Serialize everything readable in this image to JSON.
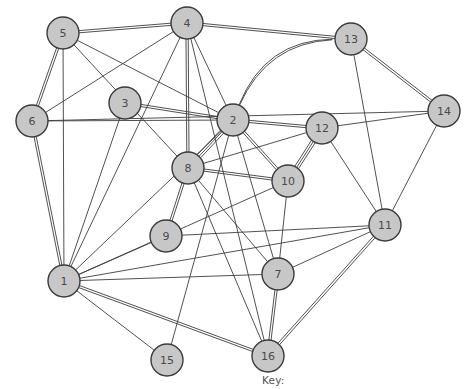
{
  "figure": {
    "title": "",
    "key_label": "Key:",
    "background": "#ffffff",
    "node_fill": "#c7c7c7",
    "node_stroke": "#3a3a3a",
    "edge_color": "#3d3d3d",
    "label_color": "#4a4a4a"
  },
  "chart_data": {
    "type": "scatter",
    "title": "",
    "xlabel": "",
    "ylabel": "",
    "graph_kind": "undirected-multigraph",
    "node_count": 16,
    "edge_count": 43,
    "node_radius": 16,
    "nodes": [
      {
        "id": "1",
        "label": "1",
        "x": 64,
        "y": 281
      },
      {
        "id": "2",
        "label": "2",
        "x": 233,
        "y": 120
      },
      {
        "id": "3",
        "label": "3",
        "x": 125,
        "y": 103
      },
      {
        "id": "4",
        "label": "4",
        "x": 187,
        "y": 23
      },
      {
        "id": "5",
        "label": "5",
        "x": 63,
        "y": 33
      },
      {
        "id": "6",
        "label": "6",
        "x": 32,
        "y": 121
      },
      {
        "id": "7",
        "label": "7",
        "x": 278,
        "y": 274
      },
      {
        "id": "8",
        "label": "8",
        "x": 188,
        "y": 168
      },
      {
        "id": "9",
        "label": "9",
        "x": 166,
        "y": 236
      },
      {
        "id": "10",
        "label": "10",
        "x": 288,
        "y": 181
      },
      {
        "id": "11",
        "label": "11",
        "x": 385,
        "y": 225
      },
      {
        "id": "12",
        "label": "12",
        "x": 322,
        "y": 128
      },
      {
        "id": "13",
        "label": "13",
        "x": 351,
        "y": 39
      },
      {
        "id": "14",
        "label": "14",
        "x": 444,
        "y": 111
      },
      {
        "id": "15",
        "label": "15",
        "x": 167,
        "y": 360
      },
      {
        "id": "16",
        "label": "16",
        "x": 268,
        "y": 356
      }
    ],
    "edges": [
      {
        "source": "5",
        "target": "4",
        "multiplicity": 2
      },
      {
        "source": "5",
        "target": "6",
        "multiplicity": 2
      },
      {
        "source": "5",
        "target": "1",
        "multiplicity": 1
      },
      {
        "source": "5",
        "target": "2",
        "multiplicity": 1
      },
      {
        "source": "5",
        "target": "8",
        "multiplicity": 1
      },
      {
        "source": "4",
        "target": "13",
        "multiplicity": 2
      },
      {
        "source": "4",
        "target": "8",
        "multiplicity": 2
      },
      {
        "source": "4",
        "target": "2",
        "multiplicity": 1
      },
      {
        "source": "4",
        "target": "1",
        "multiplicity": 1
      },
      {
        "source": "4",
        "target": "16",
        "multiplicity": 1
      },
      {
        "source": "4",
        "target": "6",
        "multiplicity": 1
      },
      {
        "source": "6",
        "target": "2",
        "multiplicity": 1
      },
      {
        "source": "6",
        "target": "1",
        "multiplicity": 2
      },
      {
        "source": "6",
        "target": "14",
        "multiplicity": 1
      },
      {
        "source": "3",
        "target": "2",
        "multiplicity": 2
      },
      {
        "source": "3",
        "target": "1",
        "multiplicity": 1
      },
      {
        "source": "13",
        "target": "2",
        "multiplicity": 2,
        "curved": true
      },
      {
        "source": "13",
        "target": "11",
        "multiplicity": 1
      },
      {
        "source": "13",
        "target": "14",
        "multiplicity": 2
      },
      {
        "source": "2",
        "target": "12",
        "multiplicity": 2
      },
      {
        "source": "2",
        "target": "8",
        "multiplicity": 3
      },
      {
        "source": "2",
        "target": "10",
        "multiplicity": 2
      },
      {
        "source": "2",
        "target": "7",
        "multiplicity": 1
      },
      {
        "source": "2",
        "target": "1",
        "multiplicity": 1
      },
      {
        "source": "2",
        "target": "15",
        "multiplicity": 1
      },
      {
        "source": "12",
        "target": "14",
        "multiplicity": 1
      },
      {
        "source": "12",
        "target": "10",
        "multiplicity": 3
      },
      {
        "source": "12",
        "target": "8",
        "multiplicity": 1
      },
      {
        "source": "12",
        "target": "11",
        "multiplicity": 1
      },
      {
        "source": "8",
        "target": "10",
        "multiplicity": 2
      },
      {
        "source": "8",
        "target": "9",
        "multiplicity": 2
      },
      {
        "source": "8",
        "target": "16",
        "multiplicity": 1
      },
      {
        "source": "8",
        "target": "7",
        "multiplicity": 1
      },
      {
        "source": "10",
        "target": "7",
        "multiplicity": 1
      },
      {
        "source": "10",
        "target": "1",
        "multiplicity": 1
      },
      {
        "source": "9",
        "target": "1",
        "multiplicity": 1
      },
      {
        "source": "9",
        "target": "11",
        "multiplicity": 1
      },
      {
        "source": "11",
        "target": "7",
        "multiplicity": 1
      },
      {
        "source": "11",
        "target": "16",
        "multiplicity": 2
      },
      {
        "source": "11",
        "target": "1",
        "multiplicity": 1
      },
      {
        "source": "14",
        "target": "11",
        "multiplicity": 1
      },
      {
        "source": "7",
        "target": "16",
        "multiplicity": 2
      },
      {
        "source": "7",
        "target": "1",
        "multiplicity": 1
      },
      {
        "source": "1",
        "target": "16",
        "multiplicity": 2
      },
      {
        "source": "1",
        "target": "15",
        "multiplicity": 1
      }
    ]
  }
}
